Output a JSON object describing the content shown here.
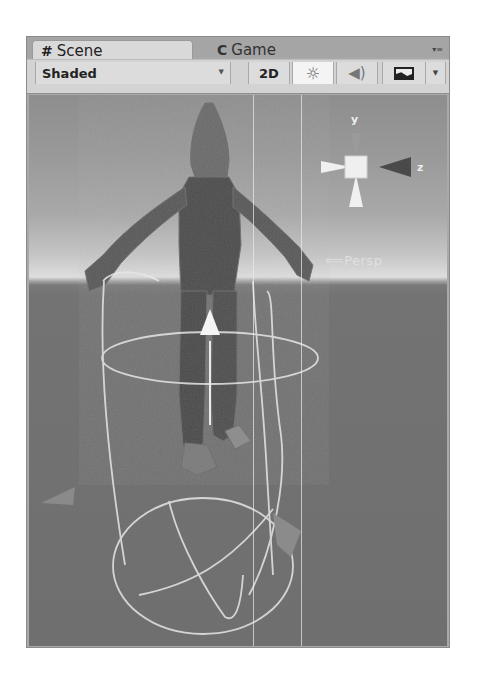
{
  "tabs": [
    {
      "label": "Scene",
      "icon": "grid-hash-icon",
      "glyph": "#",
      "active": true
    },
    {
      "label": "Game",
      "icon": "pacman-game-icon",
      "glyph": "C",
      "active": false
    }
  ],
  "tab_menu": {
    "glyph": "▾≡",
    "icon": "panel-menu-icon"
  },
  "toolbar": {
    "draw_mode": {
      "selected": "Shaded",
      "caret": "▼"
    },
    "mode_2d": "2D",
    "lighting_glyph": "☼",
    "audio_glyph": "◀)",
    "effects_caret": "▼"
  },
  "viewport": {
    "gizmo": {
      "y_label": "y",
      "z_label": "z"
    },
    "projection_label": "⟸Persp",
    "horizon_y": 186,
    "colors": {
      "sky_top": "#8e8e8e",
      "horizon": "#dedede",
      "ground": "#6f6f6f",
      "gizmo_light": "#f0f0f0",
      "gizmo_dark": "#4a4a4a"
    }
  }
}
